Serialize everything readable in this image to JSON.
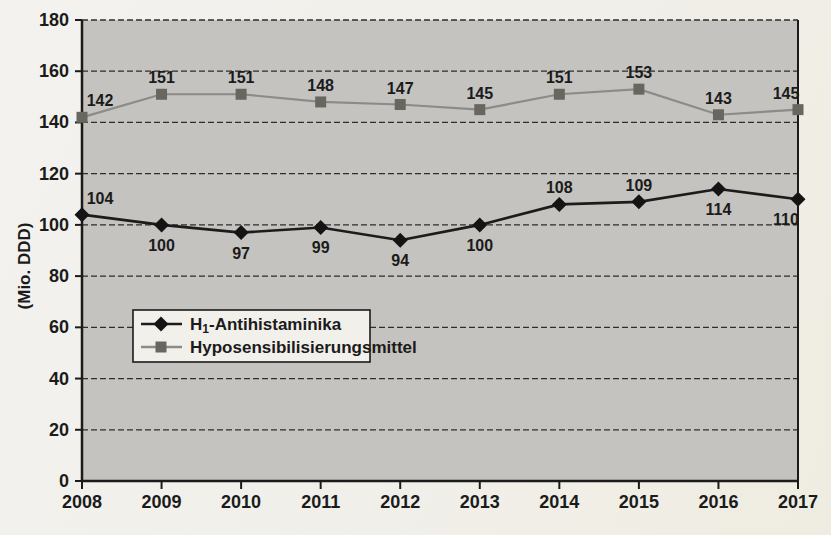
{
  "chart_data": {
    "type": "line",
    "categories": [
      "2008",
      "2009",
      "2010",
      "2011",
      "2012",
      "2013",
      "2014",
      "2015",
      "2016",
      "2017"
    ],
    "series": [
      {
        "name": "H₁-Antihistaminika",
        "legend_parts": [
          {
            "t": "H"
          },
          {
            "t": "1",
            "sub": true
          },
          {
            "t": "-Antihistaminika"
          }
        ],
        "marker": "diamond",
        "line_color": "#1c1c1c",
        "marker_color": "#141414",
        "values": [
          104,
          100,
          97,
          99,
          94,
          100,
          108,
          109,
          114,
          110
        ],
        "label_positions": [
          "above",
          "below",
          "below",
          "below",
          "below",
          "below",
          "above",
          "above",
          "below",
          "below"
        ]
      },
      {
        "name": "Hyposensibilisierungsmittel",
        "legend_parts": [
          {
            "t": "Hyposensibilisierungsmittel"
          }
        ],
        "marker": "square",
        "line_color": "#8b8b87",
        "marker_color": "#67675f",
        "values": [
          142,
          151,
          151,
          148,
          147,
          145,
          151,
          153,
          143,
          145
        ],
        "label_positions": [
          "above",
          "above",
          "above",
          "above",
          "above",
          "above",
          "above",
          "above",
          "above",
          "above"
        ]
      }
    ],
    "ylabel": "(Mio. DDD)",
    "ylim": [
      0,
      180
    ],
    "ytick_step": 20,
    "grid": "dashed-horizontal",
    "legend_position": "inside-left-middle",
    "colors": {
      "page_background": "#f1efea",
      "plot_background": "#c4c3bf",
      "grid": "#2e2e2c",
      "axis": "#1b1b1b",
      "text": "#1b1b1b",
      "legend_background": "#f2f0eb",
      "legend_border": "#1b1b1b"
    }
  }
}
